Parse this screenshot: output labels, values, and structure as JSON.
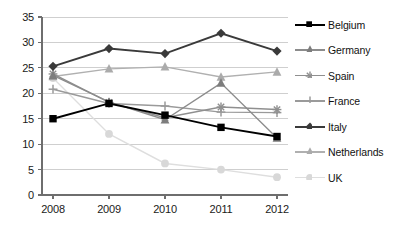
{
  "chart_data": {
    "type": "line",
    "title": "",
    "subtitle": "",
    "xlabel": "",
    "ylabel": "",
    "categories": [
      "2008",
      "2009",
      "2010",
      "2011",
      "2012"
    ],
    "x": [
      2008,
      2009,
      2010,
      2011,
      2012
    ],
    "ylim": [
      0,
      35
    ],
    "yticks": [
      0,
      5,
      10,
      15,
      20,
      25,
      30,
      35
    ],
    "ytick_labels": [
      "0",
      "5",
      "10",
      "15",
      "20",
      "25",
      "30",
      "35"
    ],
    "grid": true,
    "grid_axis": "y",
    "legend_position": "right",
    "series": [
      {
        "name": "Belgium",
        "values": [
          15.0,
          18.0,
          15.7,
          13.3,
          11.5
        ],
        "color": "#000000",
        "marker": "square",
        "marker_color": "#000000"
      },
      {
        "name": "Germany",
        "values": [
          23.5,
          18.3,
          14.8,
          22.0,
          11.2
        ],
        "color": "#8c8c8c",
        "marker": "triangle",
        "marker_color": "#7d7d7d"
      },
      {
        "name": "Spain",
        "values": [
          23.8,
          18.2,
          15.2,
          17.3,
          16.8
        ],
        "color": "#8f8f8f",
        "marker": "asterisk",
        "marker_color": "#8f8f8f"
      },
      {
        "name": "France",
        "values": [
          20.8,
          18.0,
          17.5,
          16.3,
          16.2
        ],
        "color": "#9a9a9a",
        "marker": "plus",
        "marker_color": "#9a9a9a"
      },
      {
        "name": "Italy",
        "values": [
          25.3,
          28.8,
          27.8,
          31.8,
          28.3
        ],
        "color": "#3a3a3a",
        "marker": "diamond",
        "marker_color": "#3a3a3a"
      },
      {
        "name": "Netherlands",
        "values": [
          23.3,
          24.8,
          25.2,
          23.2,
          24.2
        ],
        "color": "#b0b0b0",
        "marker": "triangle",
        "marker_color": "#ababab"
      },
      {
        "name": "UK",
        "values": [
          23.0,
          12.0,
          6.2,
          5.0,
          3.5
        ],
        "color": "#dedede",
        "marker": "circle",
        "marker_color": "#d8d8d8"
      }
    ]
  },
  "axis": {
    "y_labels": [
      "35",
      "30",
      "25",
      "20",
      "15",
      "10",
      "5",
      "0"
    ],
    "x_labels": [
      "2008",
      "2009",
      "2010",
      "2011",
      "2012"
    ]
  },
  "legend": {
    "items": [
      {
        "label": "Belgium"
      },
      {
        "label": "Germany"
      },
      {
        "label": "Spain"
      },
      {
        "label": "France"
      },
      {
        "label": "Italy"
      },
      {
        "label": "Netherlands"
      },
      {
        "label": "UK"
      }
    ]
  },
  "colors": {
    "axis": "#6e6e6e",
    "grid": "#cfcfcf",
    "text": "#1a1a1a",
    "background": "#ffffff"
  }
}
